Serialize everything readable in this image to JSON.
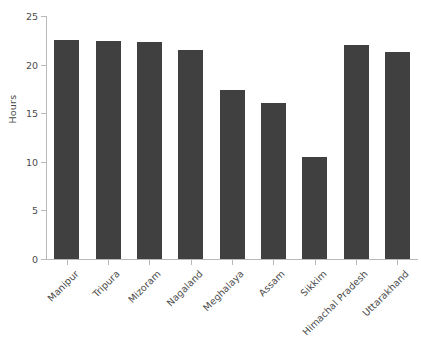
{
  "chart_data": {
    "type": "bar",
    "title": "",
    "subtitle": "",
    "xlabel": "",
    "ylabel": "Hours",
    "categories": [
      "Manipur",
      "Tripura",
      "Mizoram",
      "Nagaland",
      "Meghalaya",
      "Assam",
      "Sikkim",
      "Himachal Pradesh",
      "Uttarakhand"
    ],
    "values": [
      22.5,
      22.4,
      22.3,
      21.5,
      17.4,
      16.0,
      10.5,
      22.0,
      21.3
    ],
    "ylim": [
      0,
      25
    ],
    "yticks": [
      0,
      5,
      10,
      15,
      20,
      25
    ],
    "ytick_labels": [
      "0",
      "5",
      "10",
      "15",
      "20",
      "25"
    ],
    "grid": false,
    "legend": null,
    "legend_position": "none",
    "bar_color": "#404040",
    "axis_color": "#b9b9b9",
    "text_color": "#4b4b4b",
    "background_color": "#ffffff",
    "xlabel_rotation": -45,
    "annotations": []
  }
}
